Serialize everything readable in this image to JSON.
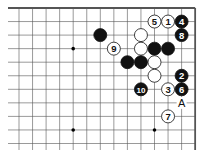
{
  "board": {
    "origin_x": 19,
    "origin_y": 8,
    "spacing": 13.55,
    "cols": 14,
    "rows": 11,
    "top_edge": true,
    "right_edge": true,
    "star_points": [
      [
        4,
        3
      ],
      [
        4,
        9
      ],
      [
        10,
        9
      ]
    ],
    "stones": [
      {
        "col": 10,
        "row": 1,
        "color": "white",
        "label": "5"
      },
      {
        "col": 11,
        "row": 1,
        "color": "white",
        "label": "1"
      },
      {
        "col": 12,
        "row": 1,
        "color": "black",
        "label": "4"
      },
      {
        "col": 12,
        "row": 2,
        "color": "black",
        "label": "8"
      },
      {
        "col": 6,
        "row": 2,
        "color": "black",
        "label": ""
      },
      {
        "col": 9,
        "row": 2,
        "color": "white",
        "label": ""
      },
      {
        "col": 7,
        "row": 3,
        "color": "white",
        "label": "9"
      },
      {
        "col": 9,
        "row": 3,
        "color": "white",
        "label": ""
      },
      {
        "col": 10,
        "row": 3,
        "color": "black",
        "label": ""
      },
      {
        "col": 11,
        "row": 3,
        "color": "black",
        "label": ""
      },
      {
        "col": 8,
        "row": 4,
        "color": "black",
        "label": ""
      },
      {
        "col": 9,
        "row": 4,
        "color": "black",
        "label": ""
      },
      {
        "col": 10,
        "row": 4,
        "color": "white",
        "label": ""
      },
      {
        "col": 10,
        "row": 5,
        "color": "white",
        "label": ""
      },
      {
        "col": 12,
        "row": 5,
        "color": "black",
        "label": "2"
      },
      {
        "col": 9,
        "row": 6,
        "color": "black",
        "label": "10"
      },
      {
        "col": 11,
        "row": 6,
        "color": "white",
        "label": "3"
      },
      {
        "col": 12,
        "row": 6,
        "color": "black",
        "label": "6"
      },
      {
        "col": 11,
        "row": 8,
        "color": "white",
        "label": "7"
      }
    ],
    "marks": [
      {
        "col": 12,
        "row": 7,
        "label": "A"
      }
    ]
  }
}
